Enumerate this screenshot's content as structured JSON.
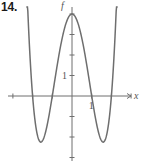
{
  "problem": {
    "number": "14."
  },
  "chart_data": {
    "type": "line",
    "title": "",
    "function": "f(x) = (x^2 - 1)(x^2 - 4)",
    "xlabel": "x",
    "ylabel": "f",
    "xlim": [
      -3.1,
      3.1
    ],
    "ylim": [
      -3.3,
      4.5
    ],
    "x_ticks": [
      -3,
      -2,
      -1,
      1,
      2,
      3
    ],
    "y_ticks": [
      -3,
      -2,
      -1,
      1,
      2,
      3,
      4
    ],
    "x_tick_labels": {
      "1": "1"
    },
    "y_tick_labels": {
      "1": "1"
    },
    "grid": false,
    "legend": null,
    "series": [
      {
        "name": "f",
        "x": [
          -2.3,
          -2.2,
          -2.0,
          -1.8,
          -1.58,
          -1.4,
          -1.2,
          -1.0,
          -0.8,
          -0.6,
          -0.4,
          -0.2,
          0.0,
          0.2,
          0.4,
          0.6,
          0.8,
          1.0,
          1.2,
          1.4,
          1.58,
          1.8,
          2.0,
          2.2,
          2.3
        ],
        "values": [
          5.5,
          3.36,
          0.0,
          -1.69,
          -2.25,
          -1.92,
          -1.08,
          0.0,
          1.21,
          2.33,
          3.23,
          3.8,
          4.0,
          3.8,
          3.23,
          2.33,
          1.21,
          0.0,
          -1.08,
          -1.92,
          -2.25,
          -1.69,
          0.0,
          3.36,
          5.5
        ]
      }
    ],
    "key_points": {
      "x_intercepts": [
        -2,
        -1,
        1,
        2
      ],
      "local_max": [
        0,
        4
      ],
      "local_min": [
        [
          -1.58,
          -2.25
        ],
        [
          1.58,
          -2.25
        ]
      ]
    }
  },
  "style": {
    "curve_color": "#6e6e6e",
    "axis_color": "#6e6e6e"
  }
}
